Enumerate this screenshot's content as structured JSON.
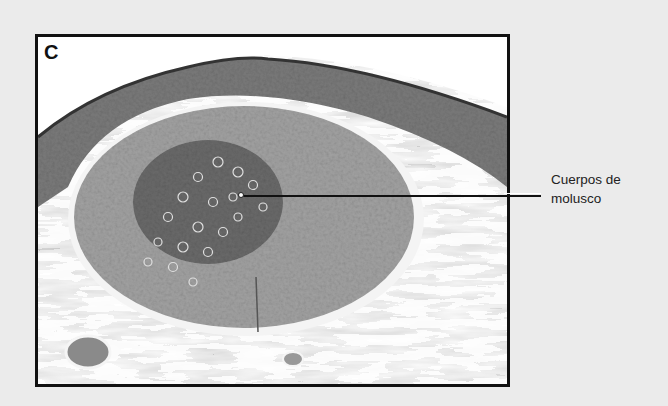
{
  "figure": {
    "panel_letter": "C",
    "annotation": {
      "line1": "Cuerpos de",
      "line2": "molusco"
    },
    "colors": {
      "background": "#ebebeb",
      "frame_border": "#111111",
      "stroma": "#c8c8c8",
      "epidermis": "#6e6e6e",
      "lesion_core": "#9a9a9a",
      "molluscum_bodies": "#5a5a5a"
    }
  }
}
